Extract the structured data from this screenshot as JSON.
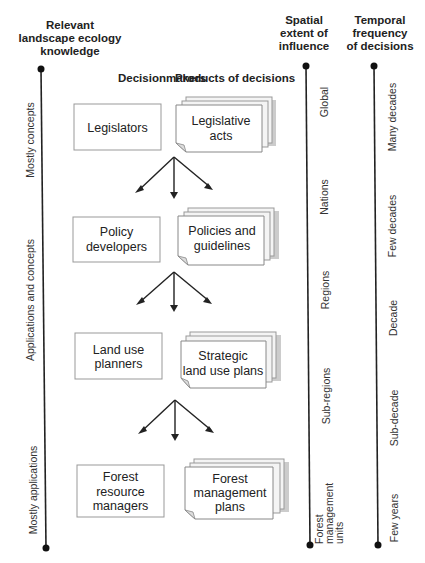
{
  "headers": {
    "knowledge": [
      "Relevant",
      "landscape ecology",
      "knowledge"
    ],
    "decisionmakers": "Decisionmakers",
    "products": "Products of decisions",
    "spatial": [
      "Spatial",
      "extent of",
      "influence"
    ],
    "temporal": [
      "Temporal",
      "frequency",
      "of decisions"
    ]
  },
  "knowledge_axis": {
    "labels": [
      "Mostly concepts",
      "Applications and concepts",
      "Mostly applications"
    ]
  },
  "levels": [
    {
      "decisionmaker": [
        "Legislators"
      ],
      "product": [
        "Legislative",
        "acts"
      ]
    },
    {
      "decisionmaker": [
        "Policy",
        "developers"
      ],
      "product": [
        "Policies and",
        "guidelines"
      ]
    },
    {
      "decisionmaker": [
        "Land use",
        "planners"
      ],
      "product": [
        "Strategic",
        "land use plans"
      ]
    },
    {
      "decisionmaker": [
        "Forest",
        "resource",
        "managers"
      ],
      "product": [
        "Forest",
        "management",
        "plans"
      ]
    }
  ],
  "spatial_axis": {
    "labels": [
      "Global",
      "Nations",
      "Regions",
      "Sub-regions"
    ],
    "end_label": [
      "Forest",
      "management",
      "units"
    ]
  },
  "temporal_axis": {
    "labels": [
      "Many decades",
      "Few decades",
      "Decade",
      "Sub-decade",
      "Few years"
    ]
  },
  "colors": {
    "line": "#222222",
    "box_border": "#999999",
    "shadow": "#cccccc"
  }
}
